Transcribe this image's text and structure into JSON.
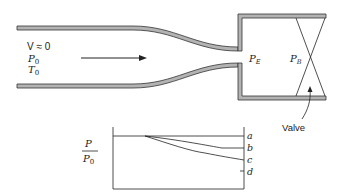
{
  "diagram": {
    "nozzle": {
      "inlet_conditions": {
        "velocity_label": "V ≈ 0",
        "pressure_label": "P",
        "pressure_sub": "0",
        "temperature_label": "T",
        "temperature_sub": "0"
      },
      "flow_direction": "left-to-right",
      "exit_pressure_label": "P",
      "exit_pressure_sub": "E",
      "back_pressure_label": "P",
      "back_pressure_sub": "B",
      "valve_label": "Valve"
    },
    "pressure_plot": {
      "ylabel_num": "P",
      "ylabel_den": "P",
      "ylabel_den_sub": "0",
      "curve_labels": [
        "a",
        "b",
        "c",
        "d"
      ]
    },
    "colors": {
      "wall_fill": "#b3b3b3",
      "wall_stroke": "#333333",
      "line": "#222222"
    }
  }
}
